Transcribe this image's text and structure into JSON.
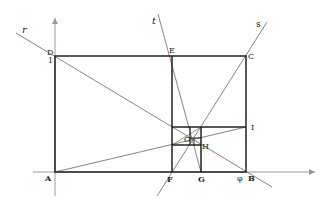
{
  "diagram": {
    "colors": {
      "thick": "#222222",
      "thin": "#777777",
      "axis": "#999999"
    },
    "labels": {
      "A": "A",
      "B": "B",
      "C": "C",
      "D": "D",
      "E": "E",
      "F": "F",
      "G": "G",
      "H": "H",
      "I": "I",
      "O": "O",
      "one": "1",
      "phi": "φ",
      "r": "r",
      "s": "s",
      "t": "t"
    }
  }
}
